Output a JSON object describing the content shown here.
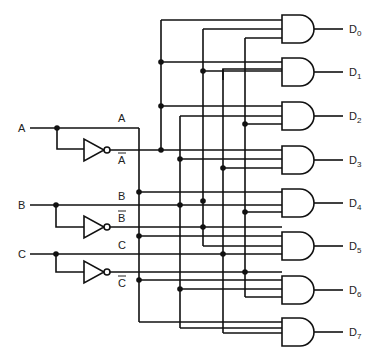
{
  "diagram": {
    "inputs": [
      {
        "name": "A",
        "true_label": "A",
        "complement_label": "A",
        "y": 128
      },
      {
        "name": "B",
        "true_label": "B",
        "complement_label": "B",
        "y": 205
      },
      {
        "name": "C",
        "true_label": "C",
        "complement_label": "C",
        "y": 254
      }
    ],
    "outputs": [
      {
        "label": "D",
        "sub": "0"
      },
      {
        "label": "D",
        "sub": "1"
      },
      {
        "label": "D",
        "sub": "2"
      },
      {
        "label": "D",
        "sub": "3"
      },
      {
        "label": "D",
        "sub": "4"
      },
      {
        "label": "D",
        "sub": "5"
      },
      {
        "label": "D",
        "sub": "6"
      },
      {
        "label": "D",
        "sub": "7"
      }
    ],
    "components": {
      "inverters": 3,
      "and_gates": 8,
      "and_gate_inputs": 3
    },
    "stroke_color": "#111111",
    "background": "#ffffff"
  }
}
